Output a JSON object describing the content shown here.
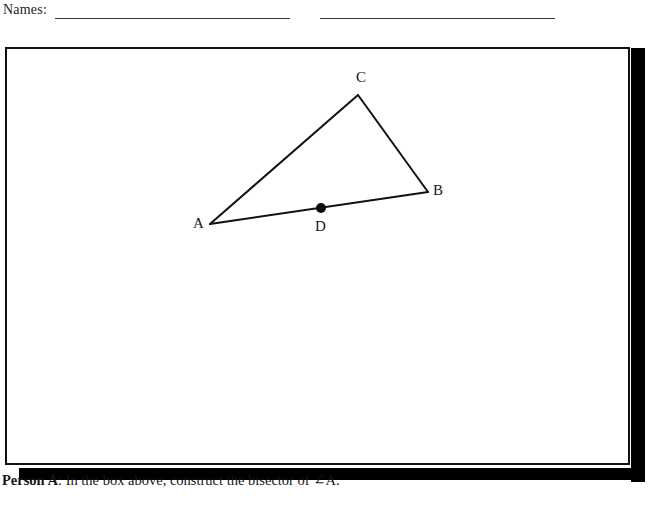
{
  "page": {
    "width": 658,
    "height": 517,
    "background": "#ffffff",
    "ink_color": "#111111"
  },
  "header": {
    "names_label": "Names:",
    "blank_lines": [
      {
        "name": "first-name-blank"
      },
      {
        "name": "second-name-blank"
      }
    ]
  },
  "construction_box": {
    "border_color": "#111111",
    "fill_color": "#ffffff",
    "shadow_color": "#000000"
  },
  "figure": {
    "type": "triangle-with-point",
    "stroke_color": "#111111",
    "stroke_width": 2,
    "vertices": [
      {
        "id": "A",
        "label": "A",
        "x": 210,
        "y": 202
      },
      {
        "id": "B",
        "label": "B",
        "x": 428,
        "y": 170
      },
      {
        "id": "C",
        "label": "C",
        "x": 358,
        "y": 73
      }
    ],
    "points": [
      {
        "id": "D",
        "label": "D",
        "x": 321,
        "y": 186,
        "on_segment": "AB",
        "style": "filled-dot",
        "radius": 5
      }
    ],
    "segments": [
      {
        "from": "A",
        "to": "C"
      },
      {
        "from": "C",
        "to": "B"
      },
      {
        "from": "A",
        "to": "B"
      }
    ],
    "labels": {
      "a": "A",
      "b": "B",
      "c": "C",
      "d": "D"
    }
  },
  "prompt": {
    "person": "Person A",
    "colon": ":",
    "instruction": " In the box above, construct the bisector of ∠A."
  }
}
